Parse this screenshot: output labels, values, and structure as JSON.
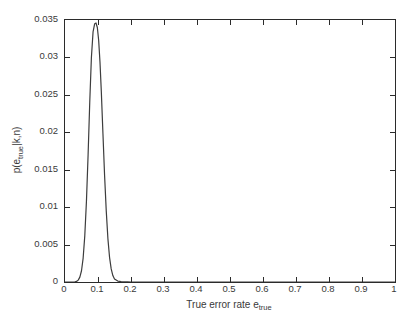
{
  "figure": {
    "background_color": "#ffffff",
    "axis_color": "#2b2b2b",
    "curve_color": "#3d3d3d"
  },
  "chart_data": {
    "type": "line",
    "title": "",
    "subtitle": "",
    "xlabel_text": "True error rate e",
    "xlabel_sub": "true",
    "ylabel_text": "p(e",
    "ylabel_sub": "true",
    "ylabel_text2": "|k,n)",
    "xlim": [
      0,
      1
    ],
    "ylim": [
      0,
      0.035
    ],
    "grid": false,
    "legend": null,
    "legend_position": "none",
    "xticks": [
      "0",
      "0.1",
      "0.2",
      "0.3",
      "0.4",
      "0.5",
      "0.6",
      "0.7",
      "0.8",
      "0.9",
      "1"
    ],
    "xtick_values": [
      0,
      0.1,
      0.2,
      0.3,
      0.4,
      0.5,
      0.6,
      0.7,
      0.8,
      0.9,
      1
    ],
    "yticks": [
      "0",
      "0.005",
      "0.01",
      "0.015",
      "0.02",
      "0.025",
      "0.03",
      "0.035"
    ],
    "ytick_values": [
      0,
      0.005,
      0.01,
      0.015,
      0.02,
      0.025,
      0.03,
      0.035
    ],
    "peak_x": 0.094,
    "peak_y": 0.0346,
    "annotations": [],
    "series": [
      {
        "name": "posterior density",
        "x": [
          0.0,
          0.01,
          0.02,
          0.03,
          0.035,
          0.04,
          0.045,
          0.05,
          0.055,
          0.06,
          0.065,
          0.07,
          0.075,
          0.08,
          0.085,
          0.09,
          0.094,
          0.098,
          0.102,
          0.106,
          0.11,
          0.115,
          0.12,
          0.125,
          0.13,
          0.135,
          0.14,
          0.145,
          0.15,
          0.16,
          0.17,
          0.18,
          0.19,
          0.2,
          0.22,
          0.24,
          0.28,
          0.32,
          0.4,
          0.5,
          0.6,
          0.7,
          0.8,
          0.9,
          1.0
        ],
        "y": [
          0.0,
          0.0,
          0.0,
          2e-05,
          8e-05,
          0.00025,
          0.00065,
          0.0015,
          0.0032,
          0.0062,
          0.0108,
          0.017,
          0.024,
          0.03,
          0.0334,
          0.0345,
          0.0346,
          0.034,
          0.0323,
          0.0294,
          0.0255,
          0.0198,
          0.0142,
          0.0095,
          0.0058,
          0.0033,
          0.00175,
          0.00086,
          0.0004,
          0.00012,
          4e-05,
          2e-05,
          1e-05,
          0.0,
          0.0,
          0.0,
          0.0,
          0.0,
          0.0,
          0.0,
          0.0,
          0.0,
          0.0,
          0.0,
          0.0
        ]
      }
    ]
  }
}
